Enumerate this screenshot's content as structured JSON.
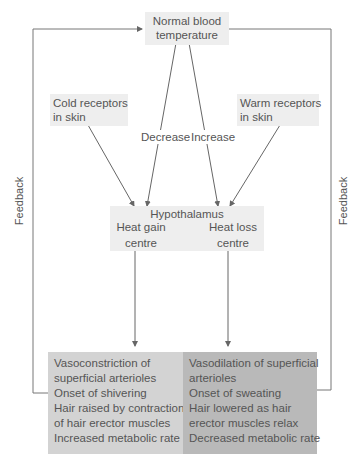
{
  "diagram": {
    "top": {
      "line1": "Normal blood",
      "line2": "temperature"
    },
    "cold": {
      "line1": "Cold receptors",
      "line2": "in skin"
    },
    "warm": {
      "line1": "Warm receptors",
      "line2": "in skin"
    },
    "decrease_label": "Decrease",
    "increase_label": "Increase",
    "hypothalamus": {
      "title": "Hypothalamus",
      "gain": {
        "line1": "Heat gain",
        "line2": "centre"
      },
      "loss": {
        "line1": "Heat loss",
        "line2": "centre"
      }
    },
    "gain_effects": [
      "Vasoconstriction of",
      "superficial arterioles",
      "Onset of shivering",
      "Hair raised by contraction",
      "of hair erector muscles",
      "Increased metabolic rate"
    ],
    "loss_effects": [
      "Vasodilation of superficial",
      "arterioles",
      "Onset of sweating",
      "Hair lowered as hair",
      "erector muscles relax",
      "Decreased metabolic rate"
    ],
    "feedback_left": "Feedback",
    "feedback_right": "Feedback",
    "colors": {
      "line": "#666666",
      "light_box": "#eeeeee",
      "gain_box": "#d3d3d3",
      "loss_box": "#b9b9b9",
      "text": "#555555"
    }
  }
}
